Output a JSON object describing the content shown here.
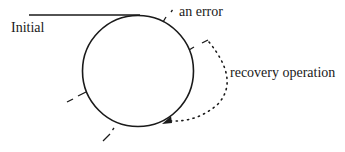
{
  "diagram": {
    "type": "state-cycle",
    "labels": {
      "initial": "Initial",
      "error": "an error",
      "recovery": "recovery operation"
    },
    "colors": {
      "stroke": "#1a1a1a",
      "background": "#ffffff"
    },
    "elements": {
      "cycle": "circle",
      "entry_line": "solid horizontal line into top of circle",
      "error_marker": "tick at upper-right of circle",
      "recovery_arrow": "dotted curved arrow from right side back to lower-right of circle",
      "dashed_ticks": [
        "left",
        "lower-left"
      ]
    }
  }
}
